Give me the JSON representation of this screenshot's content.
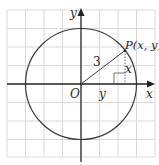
{
  "diagram": {
    "type": "unit-circle-style coordinate diagram",
    "grid": {
      "color": "#d9d9d9",
      "spacing_px": 18.5,
      "columns": 8,
      "rows": 8
    },
    "axes": {
      "color": "#231f20",
      "x_label": "x",
      "y_label": "y",
      "origin_label": "O"
    },
    "circle": {
      "radius_label": "3",
      "color": "#3a3a3a"
    },
    "point": {
      "label": "P(x, y)"
    },
    "segments": {
      "radius_label": "3",
      "vertical_leg_label": "x",
      "horizontal_leg_label": "y"
    },
    "colors": {
      "line": "#231f20",
      "grid": "#d9d9d9",
      "background": "#ffffff"
    }
  }
}
